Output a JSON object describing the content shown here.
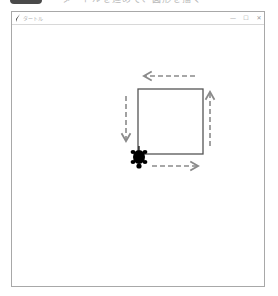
{
  "caption": {
    "badge_color": "#4a4a4a",
    "text": "ー タートルを進めて、図形を描く"
  },
  "window": {
    "title": "タートル",
    "controls": {
      "minimize": "—",
      "maximize": "☐",
      "close": "✕"
    }
  },
  "drawing": {
    "square": {
      "x": 138,
      "y": 89,
      "size": 65,
      "stroke": "#555555"
    },
    "arrows": [
      {
        "direction": "right",
        "x1": 152,
        "y1": 166,
        "x2": 197,
        "y2": 166
      },
      {
        "direction": "up",
        "x1": 210,
        "y1": 146,
        "x2": 210,
        "y2": 93
      },
      {
        "direction": "left",
        "x1": 195,
        "y1": 76,
        "x2": 145,
        "y2": 76
      },
      {
        "direction": "down",
        "x1": 126,
        "y1": 96,
        "x2": 126,
        "y2": 140
      }
    ],
    "arrow_color": "#8a8a8a",
    "turtle": {
      "x": 139,
      "y": 157,
      "heading": "down",
      "color": "#000000"
    }
  }
}
